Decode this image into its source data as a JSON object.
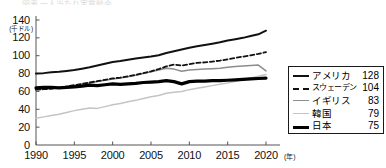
{
  "top_fragment": {
    "text": "図表 一人当たり実質賧金"
  },
  "axes": {
    "y": {
      "unit_label": "(千ドル)",
      "ticks": [
        140,
        120,
        100,
        80,
        60,
        40,
        20,
        0
      ],
      "min": 0,
      "max": 140
    },
    "x": {
      "unit_label": "(年)",
      "ticks": [
        1990,
        1995,
        2000,
        2005,
        2010,
        2015,
        2020
      ],
      "min": 1990,
      "max": 2020
    }
  },
  "legend": {
    "items": [
      {
        "name": "アメリカ",
        "value": "128",
        "style": "solid-black",
        "swatch": "sw-america"
      },
      {
        "name": "スウェーデン",
        "value": "104",
        "style": "dashed-black",
        "swatch": "sw-sweden"
      },
      {
        "name": "イギリス",
        "value": "83",
        "style": "solid-gray",
        "swatch": "sw-uk"
      },
      {
        "name": "韓国",
        "value": "79",
        "style": "solid-lightgray",
        "swatch": "sw-korea"
      },
      {
        "name": "日本",
        "value": "75",
        "style": "thick-black",
        "swatch": "sw-japan"
      }
    ]
  },
  "colors": {
    "america": "#111111",
    "sweden": "#111111",
    "uk": "#8d8d8d",
    "korea": "#c4c4c4",
    "japan": "#000000",
    "axis": "#555555",
    "background": "#ffffff"
  },
  "chart_data": {
    "type": "line",
    "title": "",
    "subtitle": "",
    "xlabel": "(年)",
    "ylabel": "(千ドル)",
    "xlim": [
      1990,
      2020
    ],
    "ylim": [
      0,
      140
    ],
    "grid": false,
    "legend_position": "right-inside",
    "x": [
      1990,
      1991,
      1992,
      1993,
      1994,
      1995,
      1996,
      1997,
      1998,
      1999,
      2000,
      2001,
      2002,
      2003,
      2004,
      2005,
      2006,
      2007,
      2008,
      2009,
      2010,
      2011,
      2012,
      2013,
      2014,
      2015,
      2016,
      2017,
      2018,
      2019,
      2020
    ],
    "series": [
      {
        "name": "アメリカ",
        "label_value": 128,
        "style": "solid-black",
        "color": "#111111",
        "width": 2.0,
        "values": [
          80,
          80.5,
          81.5,
          82,
          83,
          84,
          85.5,
          87,
          89,
          91,
          93,
          94,
          95.5,
          97,
          98,
          99,
          100.5,
          103,
          105,
          107,
          109,
          110.5,
          112,
          113.5,
          115,
          117,
          118.5,
          120,
          122,
          124,
          128
        ]
      },
      {
        "name": "スウェーデン",
        "label_value": 104,
        "style": "dashed-black",
        "color": "#111111",
        "width": 1.8,
        "values": [
          62,
          62.5,
          63,
          64,
          65.5,
          67,
          68.5,
          70,
          71.5,
          73,
          74.5,
          75.5,
          77,
          78.5,
          80.5,
          82.5,
          85,
          88,
          90,
          89,
          90.5,
          92,
          92.5,
          93.5,
          94.5,
          96,
          97.5,
          99,
          100.5,
          102,
          104
        ]
      },
      {
        "name": "イギリス",
        "label_value": 83,
        "style": "solid-gray",
        "color": "#8d8d8d",
        "width": 1.5,
        "values": [
          62,
          62.5,
          63.5,
          64.5,
          65.5,
          66.5,
          68,
          69.5,
          71,
          72.5,
          74,
          75,
          76.5,
          78,
          80,
          82,
          84,
          86,
          85,
          82.5,
          84,
          84.5,
          85,
          85.5,
          86,
          87,
          88,
          88.5,
          89,
          89.5,
          83
        ]
      },
      {
        "name": "韓国",
        "label_value": 79,
        "style": "solid-lightgray",
        "color": "#c4c4c4",
        "width": 1.5,
        "values": [
          30,
          31.5,
          33,
          34.5,
          36.5,
          38.5,
          40,
          41.5,
          41,
          43,
          45,
          46.5,
          48.5,
          50,
          52,
          54,
          55.5,
          58,
          59,
          60,
          62,
          63.5,
          65,
          66.5,
          68,
          69.5,
          71.5,
          73,
          75,
          77,
          79
        ]
      },
      {
        "name": "日本",
        "label_value": 75,
        "style": "thick-black",
        "color": "#000000",
        "width": 3.2,
        "values": [
          64,
          64.5,
          64.5,
          64,
          64.5,
          65,
          66,
          67,
          66.5,
          67.5,
          68.5,
          68,
          68.5,
          69,
          70,
          70.5,
          71,
          72,
          71,
          68.5,
          71,
          71.5,
          71.5,
          72,
          72,
          72.5,
          73,
          73.5,
          74,
          74.5,
          75
        ]
      }
    ]
  }
}
